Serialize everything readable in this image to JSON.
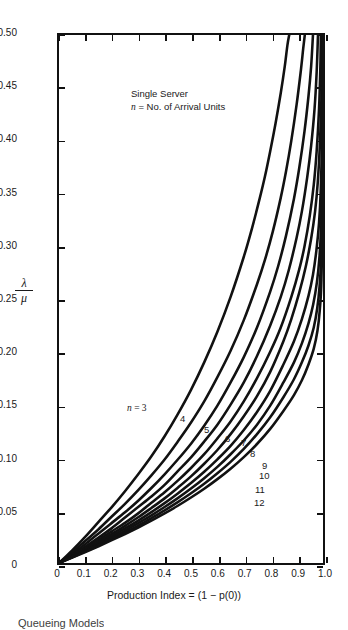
{
  "figure": {
    "annotation_line1": "Single Server",
    "annotation_line2_prefix": "n",
    "annotation_line2_rest": " = No. of Arrival Units",
    "caption": "Queueing Models"
  },
  "axes": {
    "y_title_numerator": "λ",
    "y_title_denominator": "μ",
    "x_title": "Production Index = (1 − p(0))",
    "y_ticks": [
      "0.50",
      "0.45",
      "0.40",
      "0.35",
      "0.30",
      "0.25",
      "0.20",
      "0.15",
      "0.10",
      "0.05",
      "0"
    ],
    "x_ticks": [
      "0",
      "0.1",
      "0.2",
      "0.3",
      "0.4",
      "0.5",
      "0.6",
      "0.7",
      "0.8",
      "0.9",
      "1.0"
    ]
  },
  "chart_data": {
    "type": "line",
    "title": "",
    "xlabel": "Production Index = (1 - p(0))",
    "ylabel": "lambda / mu",
    "xlim": [
      0,
      1.0
    ],
    "ylim": [
      0,
      0.5
    ],
    "grid": false,
    "legend_position": "inline-curve-labels",
    "annotations": [
      "Single Server",
      "n = No. of Arrival Units"
    ],
    "series": [
      {
        "name": "n = 3",
        "label": "3",
        "label_text": "n = 3",
        "color": "#111111",
        "points": [
          [
            0,
            0
          ],
          [
            0.05,
            0.012
          ],
          [
            0.1,
            0.025
          ],
          [
            0.15,
            0.039
          ],
          [
            0.2,
            0.053
          ],
          [
            0.25,
            0.068
          ],
          [
            0.3,
            0.084
          ],
          [
            0.35,
            0.101
          ],
          [
            0.4,
            0.12
          ],
          [
            0.45,
            0.141
          ],
          [
            0.5,
            0.164
          ],
          [
            0.55,
            0.19
          ],
          [
            0.6,
            0.219
          ],
          [
            0.65,
            0.252
          ],
          [
            0.7,
            0.29
          ],
          [
            0.73,
            0.316
          ],
          [
            0.76,
            0.345
          ],
          [
            0.78,
            0.366
          ],
          [
            0.8,
            0.39
          ],
          [
            0.82,
            0.416
          ],
          [
            0.84,
            0.445
          ],
          [
            0.855,
            0.47
          ],
          [
            0.865,
            0.49
          ],
          [
            0.872,
            0.5
          ]
        ]
      },
      {
        "name": "n = 4",
        "label": "4",
        "color": "#111111",
        "points": [
          [
            0,
            0
          ],
          [
            0.05,
            0.01
          ],
          [
            0.1,
            0.021
          ],
          [
            0.15,
            0.032
          ],
          [
            0.2,
            0.044
          ],
          [
            0.25,
            0.056
          ],
          [
            0.3,
            0.069
          ],
          [
            0.35,
            0.083
          ],
          [
            0.4,
            0.098
          ],
          [
            0.45,
            0.115
          ],
          [
            0.5,
            0.133
          ],
          [
            0.55,
            0.153
          ],
          [
            0.6,
            0.176
          ],
          [
            0.65,
            0.201
          ],
          [
            0.7,
            0.23
          ],
          [
            0.75,
            0.264
          ],
          [
            0.78,
            0.287
          ],
          [
            0.81,
            0.314
          ],
          [
            0.84,
            0.346
          ],
          [
            0.86,
            0.371
          ],
          [
            0.88,
            0.4
          ],
          [
            0.9,
            0.434
          ],
          [
            0.915,
            0.464
          ],
          [
            0.925,
            0.487
          ],
          [
            0.931,
            0.5
          ]
        ]
      },
      {
        "name": "n = 5",
        "label": "5",
        "color": "#111111",
        "points": [
          [
            0,
            0
          ],
          [
            0.05,
            0.0085
          ],
          [
            0.1,
            0.018
          ],
          [
            0.15,
            0.028
          ],
          [
            0.2,
            0.038
          ],
          [
            0.25,
            0.048
          ],
          [
            0.3,
            0.059
          ],
          [
            0.35,
            0.071
          ],
          [
            0.4,
            0.084
          ],
          [
            0.45,
            0.098
          ],
          [
            0.5,
            0.113
          ],
          [
            0.55,
            0.13
          ],
          [
            0.6,
            0.149
          ],
          [
            0.65,
            0.171
          ],
          [
            0.7,
            0.195
          ],
          [
            0.75,
            0.223
          ],
          [
            0.8,
            0.257
          ],
          [
            0.83,
            0.281
          ],
          [
            0.86,
            0.31
          ],
          [
            0.89,
            0.345
          ],
          [
            0.91,
            0.374
          ],
          [
            0.93,
            0.409
          ],
          [
            0.945,
            0.442
          ],
          [
            0.955,
            0.47
          ],
          [
            0.962,
            0.5
          ]
        ]
      },
      {
        "name": "n = 6",
        "label": "6",
        "color": "#111111",
        "points": [
          [
            0,
            0
          ],
          [
            0.05,
            0.0075
          ],
          [
            0.1,
            0.0155
          ],
          [
            0.15,
            0.024
          ],
          [
            0.2,
            0.033
          ],
          [
            0.25,
            0.043
          ],
          [
            0.3,
            0.053
          ],
          [
            0.35,
            0.063
          ],
          [
            0.4,
            0.074
          ],
          [
            0.45,
            0.087
          ],
          [
            0.5,
            0.1
          ],
          [
            0.55,
            0.115
          ],
          [
            0.6,
            0.131
          ],
          [
            0.65,
            0.15
          ],
          [
            0.7,
            0.171
          ],
          [
            0.75,
            0.196
          ],
          [
            0.8,
            0.225
          ],
          [
            0.84,
            0.252
          ],
          [
            0.87,
            0.277
          ],
          [
            0.9,
            0.308
          ],
          [
            0.92,
            0.333
          ],
          [
            0.94,
            0.365
          ],
          [
            0.955,
            0.395
          ],
          [
            0.968,
            0.43
          ],
          [
            0.976,
            0.465
          ],
          [
            0.981,
            0.5
          ]
        ]
      },
      {
        "name": "n = 7",
        "label": "7",
        "color": "#111111",
        "points": [
          [
            0,
            0
          ],
          [
            0.05,
            0.007
          ],
          [
            0.1,
            0.014
          ],
          [
            0.15,
            0.022
          ],
          [
            0.2,
            0.03
          ],
          [
            0.25,
            0.038
          ],
          [
            0.3,
            0.047
          ],
          [
            0.35,
            0.057
          ],
          [
            0.4,
            0.067
          ],
          [
            0.45,
            0.078
          ],
          [
            0.5,
            0.09
          ],
          [
            0.55,
            0.103
          ],
          [
            0.6,
            0.118
          ],
          [
            0.65,
            0.134
          ],
          [
            0.7,
            0.153
          ],
          [
            0.75,
            0.175
          ],
          [
            0.8,
            0.2
          ],
          [
            0.84,
            0.223
          ],
          [
            0.88,
            0.252
          ],
          [
            0.91,
            0.278
          ],
          [
            0.93,
            0.3
          ],
          [
            0.95,
            0.329
          ],
          [
            0.965,
            0.358
          ],
          [
            0.976,
            0.39
          ],
          [
            0.985,
            0.43
          ],
          [
            0.99,
            0.47
          ],
          [
            0.992,
            0.5
          ]
        ]
      },
      {
        "name": "n = 8",
        "label": "8",
        "color": "#111111",
        "points": [
          [
            0,
            0
          ],
          [
            0.05,
            0.0065
          ],
          [
            0.1,
            0.0132
          ],
          [
            0.15,
            0.0202
          ],
          [
            0.2,
            0.0275
          ],
          [
            0.25,
            0.0352
          ],
          [
            0.3,
            0.0433
          ],
          [
            0.35,
            0.0521
          ],
          [
            0.4,
            0.0612
          ],
          [
            0.45,
            0.0713
          ],
          [
            0.5,
            0.082
          ],
          [
            0.55,
            0.094
          ],
          [
            0.6,
            0.107
          ],
          [
            0.65,
            0.122
          ],
          [
            0.7,
            0.139
          ],
          [
            0.75,
            0.158
          ],
          [
            0.8,
            0.181
          ],
          [
            0.85,
            0.21
          ],
          [
            0.88,
            0.231
          ],
          [
            0.91,
            0.256
          ],
          [
            0.935,
            0.281
          ],
          [
            0.955,
            0.307
          ],
          [
            0.97,
            0.333
          ],
          [
            0.98,
            0.36
          ],
          [
            0.988,
            0.395
          ],
          [
            0.994,
            0.44
          ],
          [
            0.997,
            0.5
          ]
        ]
      },
      {
        "name": "n = 9",
        "label": "9",
        "color": "#111111",
        "points": [
          [
            0,
            0
          ],
          [
            0.05,
            0.006
          ],
          [
            0.1,
            0.0123
          ],
          [
            0.15,
            0.0188
          ],
          [
            0.2,
            0.0256
          ],
          [
            0.25,
            0.0327
          ],
          [
            0.3,
            0.0402
          ],
          [
            0.35,
            0.0482
          ],
          [
            0.4,
            0.0567
          ],
          [
            0.45,
            0.0659
          ],
          [
            0.5,
            0.0757
          ],
          [
            0.55,
            0.0864
          ],
          [
            0.6,
            0.0982
          ],
          [
            0.65,
            0.111
          ],
          [
            0.7,
            0.126
          ],
          [
            0.75,
            0.143
          ],
          [
            0.8,
            0.163
          ],
          [
            0.85,
            0.188
          ],
          [
            0.89,
            0.21
          ],
          [
            0.92,
            0.231
          ],
          [
            0.945,
            0.253
          ],
          [
            0.962,
            0.273
          ],
          [
            0.975,
            0.296
          ],
          [
            0.985,
            0.322
          ],
          [
            0.991,
            0.35
          ],
          [
            0.996,
            0.4
          ],
          [
            0.998,
            0.5
          ]
        ]
      },
      {
        "name": "n = 10",
        "label": "10",
        "color": "#111111",
        "points": [
          [
            0,
            0
          ],
          [
            0.05,
            0.0057
          ],
          [
            0.1,
            0.0116
          ],
          [
            0.15,
            0.0177
          ],
          [
            0.2,
            0.024
          ],
          [
            0.25,
            0.0307
          ],
          [
            0.3,
            0.0377
          ],
          [
            0.35,
            0.0451
          ],
          [
            0.4,
            0.053
          ],
          [
            0.45,
            0.0614
          ],
          [
            0.5,
            0.0705
          ],
          [
            0.55,
            0.0803
          ],
          [
            0.6,
            0.091
          ],
          [
            0.65,
            0.103
          ],
          [
            0.7,
            0.116
          ],
          [
            0.75,
            0.131
          ],
          [
            0.8,
            0.149
          ],
          [
            0.85,
            0.171
          ],
          [
            0.89,
            0.19
          ],
          [
            0.92,
            0.208
          ],
          [
            0.945,
            0.227
          ],
          [
            0.963,
            0.245
          ],
          [
            0.977,
            0.266
          ],
          [
            0.986,
            0.288
          ],
          [
            0.992,
            0.315
          ],
          [
            0.997,
            0.38
          ],
          [
            0.999,
            0.5
          ]
        ]
      },
      {
        "name": "n = 11",
        "label": "11",
        "color": "#111111",
        "points": [
          [
            0,
            0
          ],
          [
            0.05,
            0.0054
          ],
          [
            0.1,
            0.011
          ],
          [
            0.15,
            0.0168
          ],
          [
            0.2,
            0.0228
          ],
          [
            0.25,
            0.029
          ],
          [
            0.3,
            0.0355
          ],
          [
            0.35,
            0.0425
          ],
          [
            0.4,
            0.0498
          ],
          [
            0.45,
            0.0576
          ],
          [
            0.5,
            0.066
          ],
          [
            0.55,
            0.075
          ],
          [
            0.6,
            0.085
          ],
          [
            0.65,
            0.0958
          ],
          [
            0.7,
            0.108
          ],
          [
            0.75,
            0.122
          ],
          [
            0.8,
            0.138
          ],
          [
            0.85,
            0.157
          ],
          [
            0.89,
            0.174
          ],
          [
            0.92,
            0.19
          ],
          [
            0.945,
            0.206
          ],
          [
            0.965,
            0.223
          ],
          [
            0.978,
            0.241
          ],
          [
            0.987,
            0.262
          ],
          [
            0.993,
            0.29
          ],
          [
            0.997,
            0.36
          ],
          [
            0.999,
            0.5
          ]
        ]
      },
      {
        "name": "n = 12",
        "label": "12",
        "color": "#111111",
        "points": [
          [
            0,
            0
          ],
          [
            0.05,
            0.0051
          ],
          [
            0.1,
            0.0104
          ],
          [
            0.15,
            0.0159
          ],
          [
            0.2,
            0.0216
          ],
          [
            0.25,
            0.0275
          ],
          [
            0.3,
            0.0336
          ],
          [
            0.35,
            0.0401
          ],
          [
            0.4,
            0.0469
          ],
          [
            0.45,
            0.0542
          ],
          [
            0.5,
            0.062
          ],
          [
            0.55,
            0.0703
          ],
          [
            0.6,
            0.0794
          ],
          [
            0.65,
            0.0893
          ],
          [
            0.7,
            0.1003
          ],
          [
            0.75,
            0.1127
          ],
          [
            0.8,
            0.127
          ],
          [
            0.85,
            0.144
          ],
          [
            0.89,
            0.159
          ],
          [
            0.92,
            0.173
          ],
          [
            0.945,
            0.188
          ],
          [
            0.965,
            0.203
          ],
          [
            0.979,
            0.22
          ],
          [
            0.988,
            0.24
          ],
          [
            0.994,
            0.268
          ],
          [
            0.998,
            0.34
          ],
          [
            0.9995,
            0.5
          ]
        ]
      }
    ],
    "curve_labels": [
      {
        "text": "n = 3",
        "x": 127,
        "y": 403
      },
      {
        "text": "4",
        "x": 180,
        "y": 414
      },
      {
        "text": "5",
        "x": 204,
        "y": 425
      },
      {
        "text": "6",
        "x": 225,
        "y": 434
      },
      {
        "text": "7",
        "x": 241,
        "y": 438
      },
      {
        "text": "8",
        "x": 250,
        "y": 449
      },
      {
        "text": "9",
        "x": 262,
        "y": 461
      },
      {
        "text": "10",
        "x": 259,
        "y": 471
      },
      {
        "text": "11",
        "x": 255,
        "y": 485
      },
      {
        "text": "12",
        "x": 254,
        "y": 498
      }
    ]
  }
}
